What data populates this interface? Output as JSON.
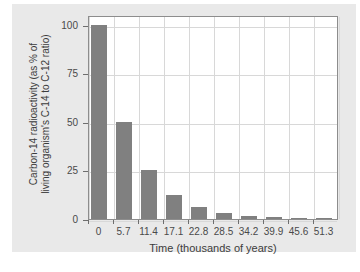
{
  "chart_data": {
    "type": "bar",
    "title": "",
    "xlabel": "Time (thousands of years)",
    "ylabel_line1": "Carbon-14 radioactivity (as % of",
    "ylabel_line2": "living organism's C-14 to C-12 ratio)",
    "ylabel": "Carbon-14 radioactivity (as % of living organism's C-14 to C-12 ratio)",
    "categories": [
      "0",
      "5.7",
      "11.4",
      "17.1",
      "22.8",
      "28.5",
      "34.2",
      "39.9",
      "45.6",
      "51.3"
    ],
    "values": [
      100,
      50,
      25,
      12.5,
      6.25,
      3.125,
      1.5625,
      0.78,
      0.39,
      0.2
    ],
    "xtick_labels": [
      "0",
      "5.7",
      "11.4",
      "17.1",
      "22.8",
      "28.5",
      "34.2",
      "39.9",
      "45.6",
      "51.3"
    ],
    "ytick_labels": [
      "0",
      "25",
      "50",
      "75",
      "100"
    ],
    "ytick_values": [
      0,
      25,
      50,
      75,
      100
    ],
    "ylim": [
      0,
      105
    ],
    "xlim": [
      0,
      57
    ],
    "grid": true,
    "legend": "none",
    "bar_color": "#808080",
    "grid_color": "#d8d8d8",
    "frame_color": "#8d8d8d",
    "background_color": "#e9e9e9",
    "plot_background_color": "#ffffff"
  }
}
